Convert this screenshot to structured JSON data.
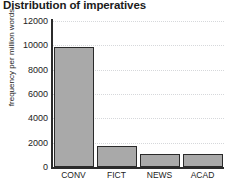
{
  "chart_data": {
    "type": "bar",
    "title": "Distribution of imperatives",
    "xlabel": "",
    "ylabel": "frequency per million words",
    "categories": [
      "CONV",
      "FICT",
      "NEWS",
      "ACAD"
    ],
    "values": [
      9900,
      1750,
      1070,
      1070
    ],
    "ylim": [
      0,
      12000
    ],
    "yticks": [
      0,
      2000,
      4000,
      6000,
      8000,
      10000,
      12000
    ],
    "ytick_labels": [
      "0",
      "2000",
      "4000",
      "6000",
      "8000",
      "10000",
      "12000"
    ],
    "grid": true,
    "legend": null,
    "series": [
      {
        "name": "imperatives",
        "values": [
          9900,
          1750,
          1070,
          1070
        ],
        "color": "#a9a9a9",
        "edge_color": "#2a2a2a"
      }
    ]
  },
  "colors": {
    "bar_fill": "#a9a9a9",
    "bar_edge": "#2a2a2a",
    "axis": "#2b2b2b",
    "grid": "#d6d8db",
    "text": "#222222",
    "background": "#ffffff"
  }
}
